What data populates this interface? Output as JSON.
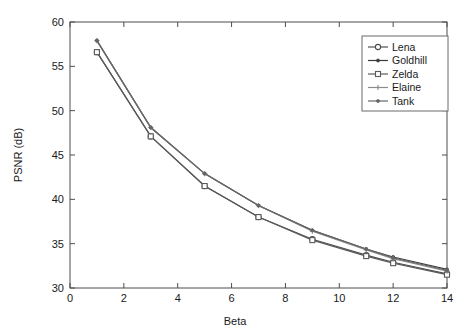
{
  "chart_data": {
    "type": "line",
    "title": "",
    "xlabel": "Beta",
    "ylabel": "PSNR (dB)",
    "xlim": [
      0,
      14
    ],
    "ylim": [
      30,
      60
    ],
    "xticks": [
      0,
      2,
      4,
      6,
      8,
      10,
      12,
      14
    ],
    "yticks": [
      30,
      35,
      40,
      45,
      50,
      55,
      60
    ],
    "xtick_labels": [
      "0",
      "2",
      "4",
      "6",
      "8",
      "10",
      "12",
      "14"
    ],
    "ytick_labels": [
      "30",
      "35",
      "40",
      "45",
      "50",
      "55",
      "60"
    ],
    "grid": false,
    "legend_position": "upper right",
    "x": [
      1,
      3,
      5,
      7,
      9,
      11,
      12,
      14
    ],
    "series": [
      {
        "name": "Lena",
        "marker": "circle",
        "color": "#4d4d4d",
        "values": [
          56.6,
          47.1,
          41.5,
          38.0,
          35.5,
          33.7,
          32.9,
          31.6
        ]
      },
      {
        "name": "Goldhill",
        "marker": "dot",
        "color": "#3a3a3a",
        "values": [
          57.9,
          48.1,
          42.9,
          39.3,
          36.5,
          34.4,
          33.5,
          32.1
        ]
      },
      {
        "name": "Zelda",
        "marker": "square",
        "color": "#5a5a5a",
        "values": [
          56.6,
          47.1,
          41.5,
          38.0,
          35.4,
          33.6,
          32.8,
          31.5
        ]
      },
      {
        "name": "Elaine",
        "marker": "plus",
        "color": "#8c8c8c",
        "values": [
          57.9,
          48.1,
          42.9,
          39.3,
          36.4,
          34.3,
          33.3,
          31.9
        ]
      },
      {
        "name": "Tank",
        "marker": "dot",
        "color": "#666666",
        "values": [
          57.9,
          48.1,
          42.9,
          39.3,
          36.5,
          34.4,
          33.4,
          32.0
        ]
      }
    ],
    "legend_entries": [
      "Lena",
      "Goldhill",
      "Zelda",
      "Elaine",
      "Tank"
    ]
  },
  "axes": {
    "x_title": "Beta",
    "y_title": "PSNR (dB)"
  }
}
